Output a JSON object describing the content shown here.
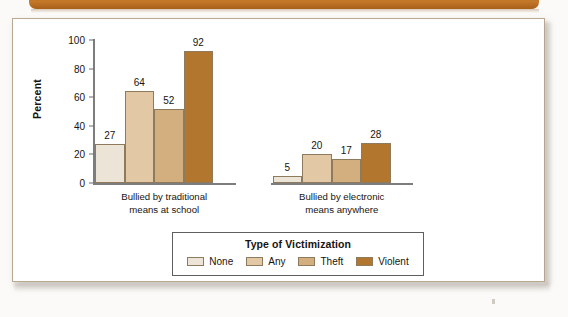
{
  "banner": {
    "name": "top-brown-banner",
    "color": "#b86a1d"
  },
  "panel": {
    "name": "chart-panel",
    "background": "#ffffff",
    "border_color": "#b9a893"
  },
  "chart_data": {
    "type": "bar",
    "title": "",
    "xlabel": "",
    "ylabel": "Percent",
    "ylim": [
      0,
      100
    ],
    "yticks": [
      0,
      20,
      40,
      60,
      80,
      100
    ],
    "grid": false,
    "legend_position": "bottom",
    "legend_title": "Type of Victimization",
    "categories": [
      "Bullied by traditional\nmeans at school",
      "Bullied by electronic\nmeans anywhere"
    ],
    "series": [
      {
        "name": "None",
        "color": "#ece4d6",
        "values": [
          27,
          5
        ]
      },
      {
        "name": "Any",
        "color": "#e2c8a5",
        "values": [
          64,
          20
        ]
      },
      {
        "name": "Theft",
        "color": "#d3ae7e",
        "values": [
          52,
          17
        ]
      },
      {
        "name": "Violent",
        "color": "#b3762f",
        "values": [
          92,
          28
        ]
      }
    ]
  }
}
